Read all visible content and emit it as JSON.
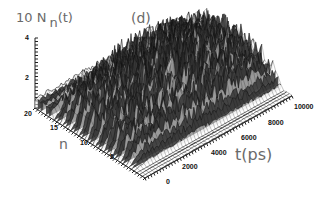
{
  "figure": {
    "panel_label": "(d)",
    "z_axis_label_prefix": "10 N",
    "z_axis_label_sub": "n",
    "z_axis_label_suffix": "(t)",
    "n_axis_label": "n",
    "t_axis_label": "t(ps)",
    "z_ticks": [
      "4",
      "2"
    ],
    "n_ticks": [
      "20",
      "15",
      "10",
      "5"
    ],
    "t_ticks": [
      "0",
      "2000",
      "4000",
      "6000",
      "8000",
      "10000"
    ],
    "colors": {
      "surface": "#1a1a1a",
      "highlight": "#e8e8e8",
      "axis": "#222222",
      "label": "#6a6a6a"
    }
  },
  "chart_data": {
    "type": "surface3d",
    "title": "(d)",
    "xlabel": "t(ps)",
    "ylabel": "n",
    "zlabel": "10 N_n(t)",
    "x_range": [
      0,
      10000
    ],
    "y_range": [
      0,
      20
    ],
    "z_range": [
      0,
      4
    ],
    "x_ticks": [
      0,
      2000,
      4000,
      6000,
      8000,
      10000
    ],
    "y_ticks": [
      5,
      10,
      15,
      20
    ],
    "z_ticks": [
      2,
      4
    ],
    "approx_profile": {
      "t": [
        0,
        1000,
        2000,
        3000,
        4000,
        5000,
        6000,
        7000,
        8000,
        9000,
        10000
      ],
      "peak_z": [
        0.8,
        2.2,
        2.6,
        2.8,
        3.2,
        3.4,
        3.5,
        3.3,
        3.0,
        2.6,
        2.4
      ],
      "mean_z_center": [
        0.5,
        1.2,
        1.5,
        1.6,
        1.8,
        1.9,
        2.0,
        1.9,
        1.7,
        1.5,
        1.4
      ]
    },
    "grid": false,
    "legend": null
  }
}
